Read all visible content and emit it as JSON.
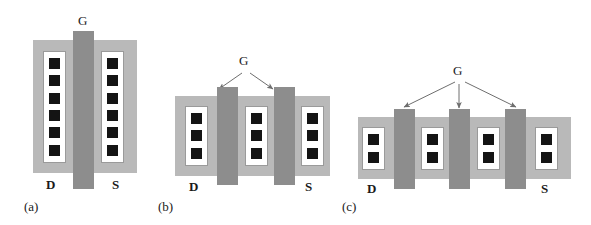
{
  "figure": {
    "colors": {
      "background": "#ffffff",
      "diffusion": "#b9b9b9",
      "gate": "#8d8d8d",
      "contact": "#141414",
      "metal": "#ffffff",
      "outline": "#9a9a9a",
      "text": "#1a1a1a"
    },
    "labels": {
      "gate": "G",
      "drain": "D",
      "source": "S"
    },
    "panels": [
      {
        "id": "a",
        "caption": "(a)",
        "gate_label": "G",
        "drain_label": "D",
        "source_label": "S",
        "gate_fingers": 1,
        "contact_columns": 2,
        "contacts_per_column": 6,
        "callout_arrows": 0
      },
      {
        "id": "b",
        "caption": "(b)",
        "gate_label": "G",
        "drain_label": "D",
        "source_label": "S",
        "gate_fingers": 2,
        "contact_columns": 3,
        "contacts_per_column": 3,
        "callout_arrows": 2
      },
      {
        "id": "c",
        "caption": "(c)",
        "gate_label": "G",
        "drain_label": "D",
        "source_label": "S",
        "gate_fingers": 3,
        "contact_columns": 4,
        "contacts_per_column": 2,
        "callout_arrows": 3
      }
    ]
  }
}
